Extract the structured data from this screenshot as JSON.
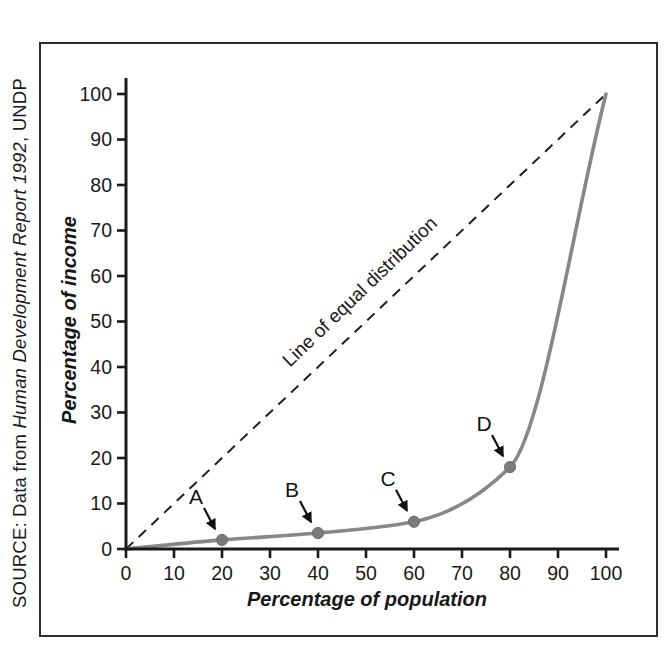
{
  "figure": {
    "source_note": {
      "prefix": "SOURCE: Data from ",
      "italic": "Human Development Report 1992",
      "suffix": ", UNDP"
    }
  },
  "chart_data": {
    "type": "line",
    "title": "",
    "xlabel": "Percentage of population",
    "ylabel": "Percentage of income",
    "xlim": [
      0,
      100
    ],
    "ylim": [
      0,
      100
    ],
    "xticks": [
      0,
      10,
      20,
      30,
      40,
      50,
      60,
      70,
      80,
      90,
      100
    ],
    "yticks": [
      0,
      10,
      20,
      30,
      40,
      50,
      60,
      70,
      80,
      90,
      100
    ],
    "grid": false,
    "legend_position": "none",
    "series": [
      {
        "name": "lorenz-curve",
        "style": "solid",
        "color": "#878787",
        "points": [
          [
            0,
            0
          ],
          [
            20,
            2
          ],
          [
            40,
            3.5
          ],
          [
            60,
            6
          ],
          [
            80,
            18
          ],
          [
            100,
            100
          ]
        ]
      },
      {
        "name": "line-of-equal-distribution",
        "style": "dashed",
        "color": "#1f1f1f",
        "label": "Line of equal distribution",
        "points": [
          [
            0,
            0
          ],
          [
            100,
            100
          ]
        ]
      }
    ],
    "marked_points": [
      {
        "label": "A",
        "x": 20,
        "y": 2
      },
      {
        "label": "B",
        "x": 40,
        "y": 3.5
      },
      {
        "label": "C",
        "x": 60,
        "y": 6
      },
      {
        "label": "D",
        "x": 80,
        "y": 18
      }
    ],
    "point_color": "#7b7b7b",
    "axis_color": "#1a1a1a",
    "arrow_color": "#111111"
  }
}
